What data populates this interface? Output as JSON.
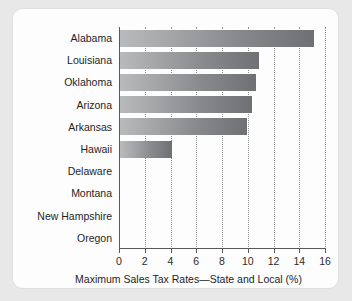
{
  "chart_data": {
    "type": "bar",
    "orientation": "horizontal",
    "title": "",
    "xlabel": "Maximum Sales Tax Rates—State and Local (%)",
    "ylabel": "",
    "xlim": [
      0,
      16
    ],
    "xticks": [
      "0",
      "2",
      "4",
      "6",
      "8",
      "10",
      "12",
      "14",
      "16"
    ],
    "xtick_values": [
      0,
      2,
      4,
      6,
      8,
      10,
      12,
      14,
      16
    ],
    "grid": "vertical-dotted",
    "legend": "none",
    "categories": [
      "Alabama",
      "Louisiana",
      "Oklahoma",
      "Arizona",
      "Arkansas",
      "Hawaii",
      "Delaware",
      "Montana",
      "New Hampshire",
      "Oregon"
    ],
    "values": [
      15.1,
      10.8,
      10.6,
      10.25,
      9.9,
      4.0,
      0,
      0,
      0,
      0
    ],
    "bar_color_start": "#b9babc",
    "bar_color_end": "#6e7073"
  },
  "style": {
    "page_background": "#e8e8e8",
    "panel_background": "#fdfdfd",
    "axis_color": "#58595b",
    "grid_color": "#8e9093",
    "text_color": "#1e1e1e"
  }
}
